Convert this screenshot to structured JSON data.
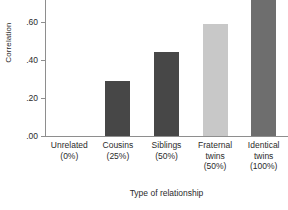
{
  "chart_data": {
    "type": "bar",
    "title": "",
    "xlabel": "Type of relationship",
    "ylabel": "Correlation",
    "categories": [
      "Unrelated",
      "Cousins",
      "Siblings",
      "Fraternal twins",
      "Identical twins"
    ],
    "category_lines": [
      [
        "Unrelated",
        "(0%)"
      ],
      [
        "Cousins",
        "(25%)"
      ],
      [
        "Siblings",
        "(50%)"
      ],
      [
        "Fraternal",
        "twins",
        "(50%)"
      ],
      [
        "Identical",
        "twins",
        "(100%)"
      ]
    ],
    "genetic_overlap": [
      "0%",
      "25%",
      "50%",
      "50%",
      "100%"
    ],
    "values": [
      0.0,
      0.29,
      0.44,
      0.59,
      0.86
    ],
    "bar_colors": [
      "#474747",
      "#474747",
      "#474747",
      "#c8c8c8",
      "#6e6e6e"
    ],
    "yticks": [
      0.0,
      0.2,
      0.4,
      0.6
    ],
    "ytick_labels": [
      ".00",
      ".20",
      ".40",
      ".60"
    ],
    "ylim": [
      0.0,
      0.72
    ],
    "grid": false,
    "legend": "none",
    "axis_color": "#8e8e8e",
    "note": "Top of the Identical twins bar is clipped by the top edge of the figure."
  }
}
